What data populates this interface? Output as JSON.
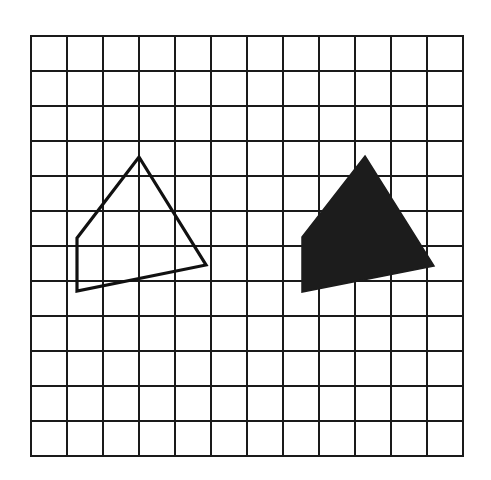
{
  "diagram": {
    "type": "grid-translation",
    "background_color": "#ffffff",
    "line_color": "#1a1a1a",
    "grid": {
      "left": 31,
      "top": 36,
      "cell_width": 36,
      "cell_height": 35,
      "columns": 12,
      "rows": 12
    },
    "shapes": [
      {
        "name": "outlined-quadrilateral",
        "style": "outline",
        "color": "#111111",
        "points": [
          [
            139,
            157
          ],
          [
            206,
            265
          ],
          [
            77,
            291
          ],
          [
            77,
            238
          ]
        ]
      },
      {
        "name": "filled-quadrilateral",
        "style": "filled",
        "color": "#1c1c1c",
        "points": [
          [
            365,
            156
          ],
          [
            434,
            266
          ],
          [
            302,
            292
          ],
          [
            302,
            237
          ]
        ]
      }
    ]
  }
}
